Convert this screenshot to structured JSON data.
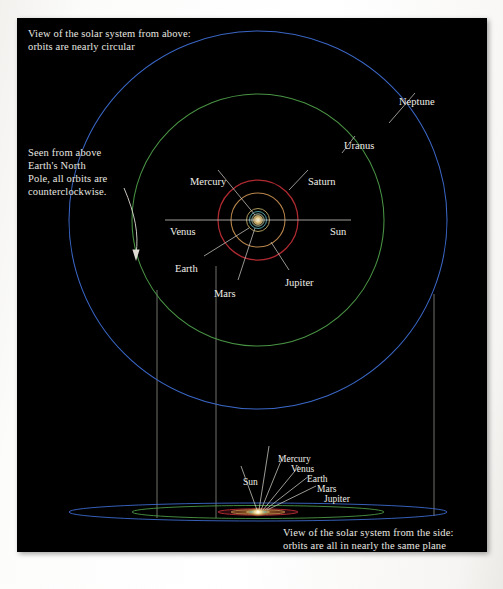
{
  "figure": {
    "background_color": "#000000",
    "page_color": "#fbfaf8",
    "captions": {
      "top_view": "View of the solar system from above:\norbits are nearly circular",
      "counterclockwise": "Seen from above\nEarth's North\nPole, all orbits are\ncounterclockwise.",
      "side_view": "View of the solar system from the side:\norbits are all in nearly the same plane"
    }
  },
  "top_view": {
    "center_label_line": {
      "left_label": "Venus",
      "right_label": "Sun"
    },
    "labels": {
      "neptune": "Neptune",
      "uranus": "Uranus",
      "saturn": "Saturn",
      "jupiter": "Jupiter",
      "mercury": "Mercury",
      "venus": "Venus",
      "earth": "Earth",
      "mars": "Mars",
      "sun": "Sun"
    },
    "orbits": [
      {
        "name": "Neptune",
        "radius_px": 189,
        "color": "#3f6fd6",
        "width": 1.0
      },
      {
        "name": "Uranus",
        "radius_px": 126,
        "color": "#4fa04a",
        "width": 1.0
      },
      {
        "name": "Saturn",
        "radius_px": 40,
        "color": "#b52b33",
        "width": 1.2
      },
      {
        "name": "Jupiter",
        "radius_px": 27,
        "color": "#c28c4e",
        "width": 1.1
      },
      {
        "name": "Mars",
        "radius_px": 11,
        "color": "#c9b36a",
        "width": 0.9
      },
      {
        "name": "Earth",
        "radius_px": 8,
        "color": "#5fbfc4",
        "width": 0.9
      },
      {
        "name": "Venus",
        "radius_px": 6,
        "color": "#8fd3d6",
        "width": 0.8
      },
      {
        "name": "Mercury",
        "radius_px": 4,
        "color": "#d8d8d2",
        "width": 0.8
      }
    ],
    "center": {
      "x": 258,
      "y": 220
    }
  },
  "side_view": {
    "labels": {
      "sun": "Sun",
      "mercury": "Mercury",
      "venus": "Venus",
      "earth": "Earth",
      "mars": "Mars",
      "jupiter": "Jupiter"
    },
    "orbits": [
      {
        "name": "Neptune",
        "rx": 189,
        "ry": 9,
        "color": "#3f6fd6"
      },
      {
        "name": "Uranus",
        "rx": 126,
        "ry": 6,
        "color": "#4fa04a"
      },
      {
        "name": "Saturn",
        "rx": 40,
        "ry": 3,
        "color": "#b52b33"
      },
      {
        "name": "Jupiter",
        "rx": 27,
        "ry": 2,
        "color": "#c28c4e"
      }
    ],
    "center": {
      "x": 258,
      "y": 512
    }
  },
  "projection_lines": {
    "count": 3,
    "x_positions": [
      157,
      216,
      434
    ],
    "color": "#8d8d86"
  },
  "colors": {
    "neptune": "#3f6fd6",
    "uranus": "#4fa04a",
    "saturn": "#b52b33",
    "jupiter": "#c28c4e",
    "mars": "#c9b36a",
    "earth": "#5fbfc4",
    "venus": "#8fd3d6",
    "mercury": "#d8d8d2",
    "sun": "#ffe9a8",
    "label_text": "#f0eee8",
    "leader_line": "#c9c7c0"
  }
}
